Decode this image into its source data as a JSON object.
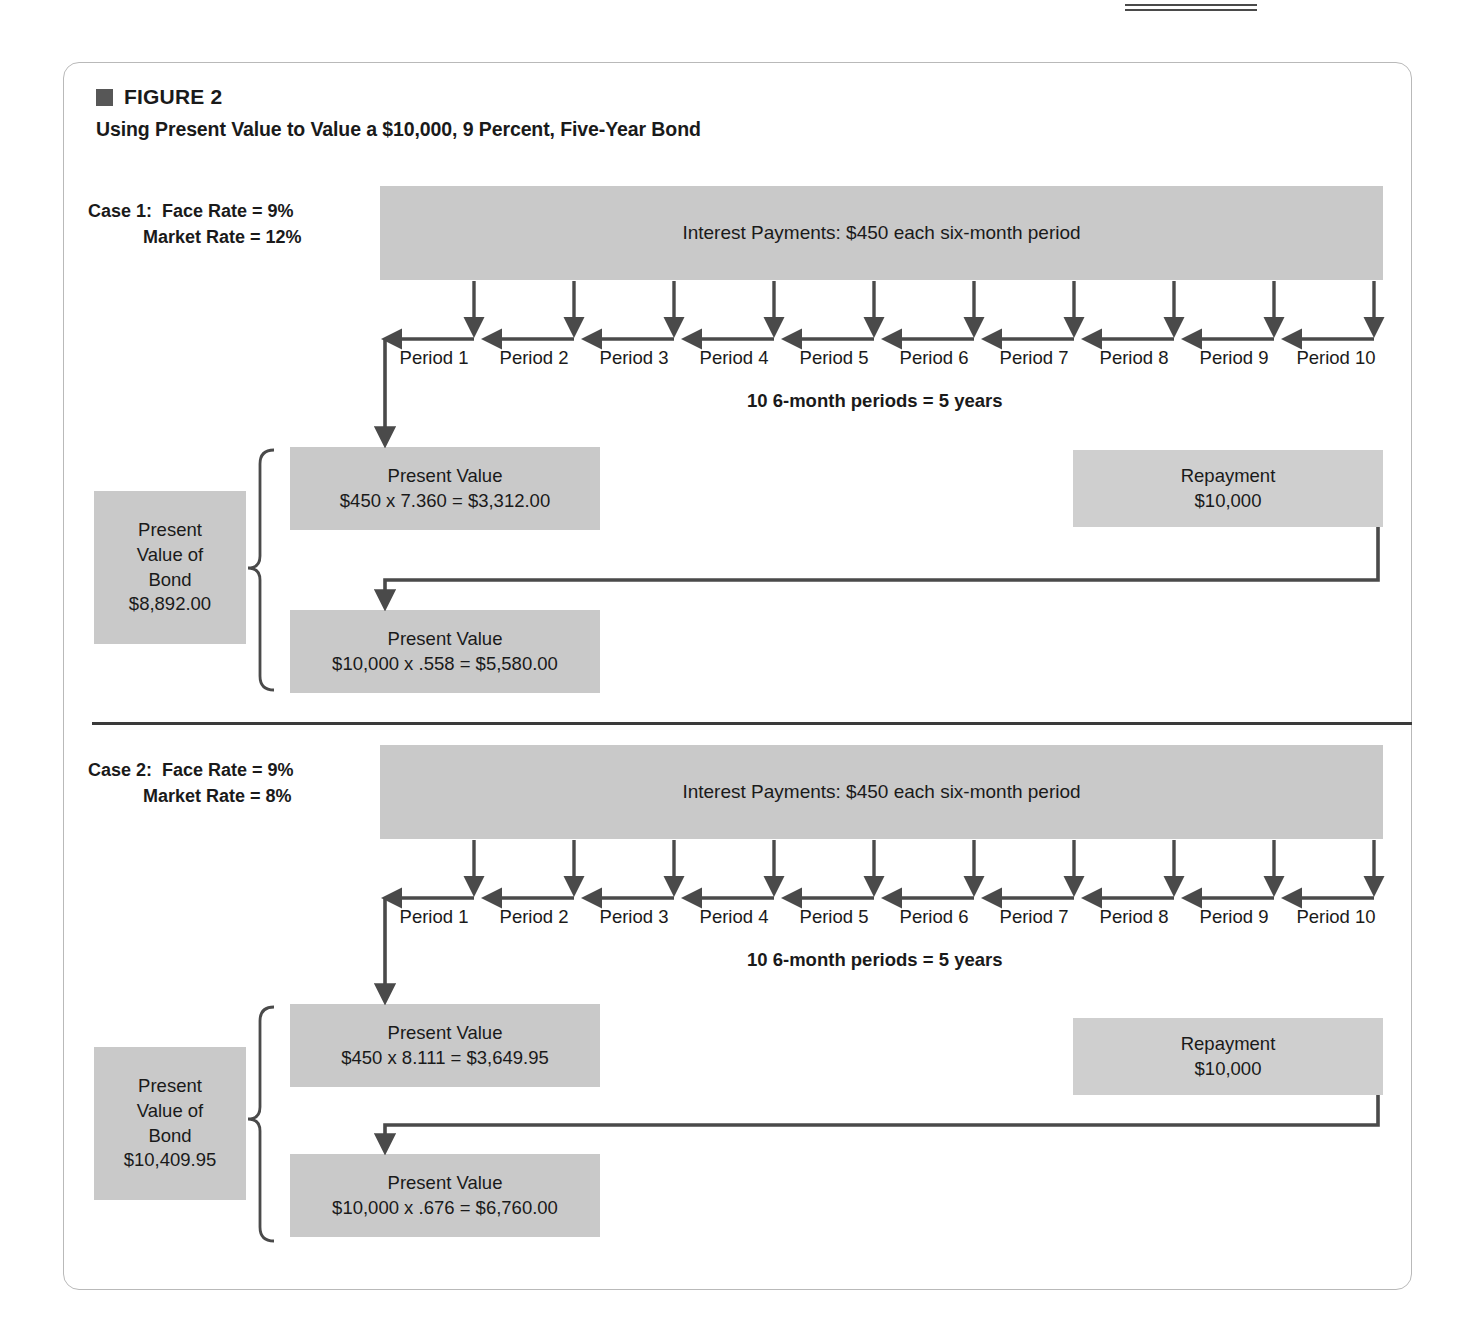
{
  "figure": {
    "marker_icon": "square-marker-icon",
    "label": "FIGURE 2",
    "title": "Using Present Value to Value a $10,000, 9 Percent, Five-Year Bond"
  },
  "period_note": "10  6-month periods = 5 years",
  "periods": [
    "Period 1",
    "Period 2",
    "Period 3",
    "Period 4",
    "Period 5",
    "Period 6",
    "Period 7",
    "Period 8",
    "Period 9",
    "Period 10"
  ],
  "cases": [
    {
      "case_title": "Case 1:",
      "face_rate_label": "Face Rate = 9%",
      "market_rate_label": "Market Rate = 12%",
      "case_block_text": "Case 1:  Face Rate = 9%\n           Market Rate = 12%",
      "interest_bar": "Interest Payments: $450 each six-month period",
      "pv_bond": {
        "l1": "Present",
        "l2": "Value of",
        "l3": "Bond",
        "l4": "$8,892.00"
      },
      "pv_interest": {
        "l1": "Present Value",
        "l2": "$450 x 7.360 = $3,312.00"
      },
      "pv_principal": {
        "l1": "Present Value",
        "l2": "$10,000 x .558 = $5,580.00"
      },
      "repayment": {
        "l1": "Repayment",
        "l2": "$10,000"
      }
    },
    {
      "case_title": "Case 2:",
      "face_rate_label": "Face Rate = 9%",
      "market_rate_label": "Market Rate = 8%",
      "case_block_text": "Case 2:  Face Rate = 9%\n           Market Rate = 8%",
      "interest_bar": "Interest Payments: $450 each six-month period",
      "pv_bond": {
        "l1": "Present",
        "l2": "Value of",
        "l3": "Bond",
        "l4": "$10,409.95"
      },
      "pv_interest": {
        "l1": "Present Value",
        "l2": "$450 x 8.111 = $3,649.95"
      },
      "pv_principal": {
        "l1": "Present Value",
        "l2": "$10,000 x .676 = $6,760.00"
      },
      "repayment": {
        "l1": "Repayment",
        "l2": "$10,000"
      }
    }
  ],
  "colors": {
    "box_gray": "#c9c9c9",
    "box_gray_light": "#cfcfcf",
    "arrow": "#4a4a4a",
    "frame": "#b9b9b9",
    "marker": "#575757"
  }
}
